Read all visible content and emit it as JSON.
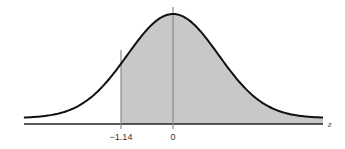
{
  "chart_data": {
    "type": "area",
    "title": "",
    "xlabel": "z",
    "ylabel": "",
    "distribution": "standard normal",
    "x_range": [
      -3.27,
      3.29
    ],
    "tick_labels": [
      {
        "z": -1.14,
        "label": "−1.14"
      },
      {
        "z": 0,
        "label": "0"
      }
    ],
    "shaded_region": {
      "from": -1.14,
      "to": "inf",
      "description": "area to the right of z = -1.14"
    },
    "vertical_lines": [
      -1.14,
      0
    ],
    "grid": false,
    "legend": null
  },
  "style": {
    "curve_color": "#111111",
    "shade_color": "#c8c8c8",
    "line_color": "#8a8a8a",
    "axis_color": "#222222"
  },
  "labels": {
    "tick_neg": "−1.14",
    "tick_zero": "0",
    "axis_var": "z"
  }
}
